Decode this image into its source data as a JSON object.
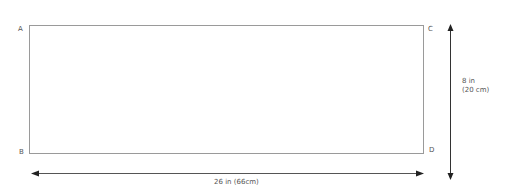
{
  "diagram": {
    "corners": {
      "a": "A",
      "b": "B",
      "c": "C",
      "d": "D"
    },
    "height_label": {
      "line1": "8 in",
      "line2": "(20 cm)"
    },
    "width_label": "26 in (66cm)",
    "colors": {
      "outline": "#999999",
      "arrow": "#333333",
      "text": "#555555"
    }
  }
}
